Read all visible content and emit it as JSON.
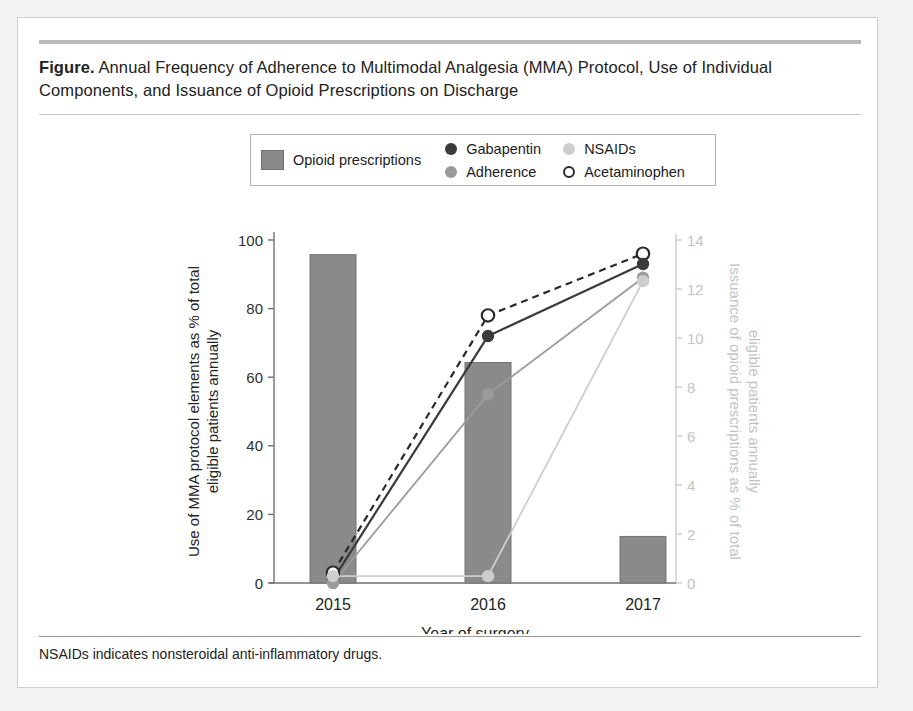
{
  "figure": {
    "label": "Figure.",
    "title": "Annual Frequency of Adherence to Multimodal Analgesia (MMA) Protocol, Use of Individual Components, and Issuance of Opioid Prescriptions on Discharge",
    "footnote": "NSAIDs indicates nonsteroidal anti-inflammatory drugs."
  },
  "legend": {
    "items": [
      {
        "label": "Opioid prescriptions",
        "marker": "bar-swatch",
        "color": "#8a8a8a"
      },
      {
        "label": "Gabapentin",
        "marker": "filled-circle-dark",
        "color": "#3a3a3a"
      },
      {
        "label": "NSAIDs",
        "marker": "filled-circle-light",
        "color": "#cdcdcd"
      },
      {
        "label": "Adherence",
        "marker": "filled-circle-mid",
        "color": "#9b9b9b"
      },
      {
        "label": "Acetaminophen",
        "marker": "open-circle",
        "color": "#2a2a2a"
      }
    ]
  },
  "chart_data": {
    "type": "bar",
    "title": "Annual Frequency of Adherence to Multimodal Analgesia (MMA) Protocol, Use of Individual Components, and Issuance of Opioid Prescriptions on Discharge",
    "xlabel": "Year of surgery",
    "ylabel": "Use of MMA protocol elements as % of total eligible patients annually",
    "y2label": "Issuance of opioid prescriptions as % of total eligible patients annually",
    "categories": [
      "2015",
      "2016",
      "2017"
    ],
    "ylim": [
      0,
      100
    ],
    "yticks": [
      0,
      20,
      40,
      60,
      80,
      100
    ],
    "y2lim": [
      0,
      14
    ],
    "y2ticks": [
      0,
      2,
      4,
      6,
      8,
      10,
      12,
      14
    ],
    "grid": false,
    "legend_position": "top-center",
    "bars": {
      "name": "Opioid prescriptions",
      "axis": "right",
      "color": "#8a8a8a",
      "values": [
        13.4,
        9.0,
        1.9
      ]
    },
    "series": [
      {
        "name": "Acetaminophen",
        "axis": "left",
        "color": "#2a2a2a",
        "line": "dashed",
        "marker": "open-circle",
        "values": [
          3,
          78,
          96
        ]
      },
      {
        "name": "Gabapentin",
        "axis": "left",
        "color": "#3a3a3a",
        "line": "solid",
        "marker": "filled-circle",
        "values": [
          1,
          72,
          93
        ]
      },
      {
        "name": "Adherence",
        "axis": "left",
        "color": "#9b9b9b",
        "line": "solid",
        "marker": "filled-circle",
        "values": [
          0,
          55,
          89
        ]
      },
      {
        "name": "NSAIDs",
        "axis": "left",
        "color": "#cdcdcd",
        "line": "solid",
        "marker": "filled-circle",
        "values": [
          2,
          2,
          88
        ]
      }
    ]
  }
}
